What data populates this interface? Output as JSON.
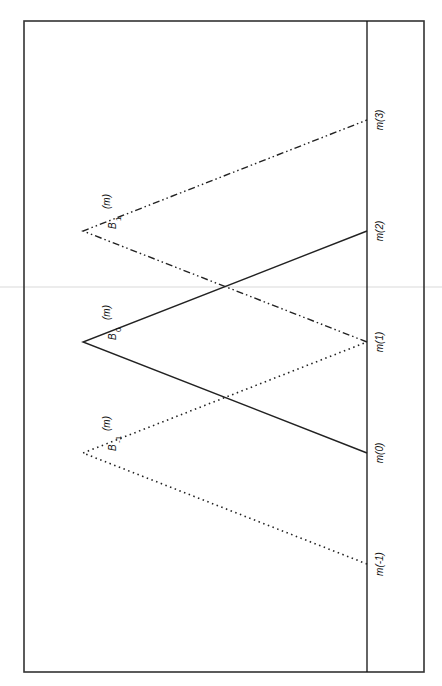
{
  "diagram": {
    "orientation": "rotated-90-clockwise",
    "knots": [
      {
        "id": "m-1",
        "label": "m(-1)",
        "index": -1
      },
      {
        "id": "m0",
        "label": "m(0)",
        "index": 0
      },
      {
        "id": "m1",
        "label": "m(1)",
        "index": 1
      },
      {
        "id": "m2",
        "label": "m(2)",
        "index": 2
      },
      {
        "id": "m3",
        "label": "m(3)",
        "index": 3
      }
    ],
    "functions": [
      {
        "id": "B-1",
        "symbol": "B",
        "subscript": "-1",
        "argument": "(m)",
        "start": -1,
        "peak": 0,
        "end": 1,
        "line_style": "dotted"
      },
      {
        "id": "B0",
        "symbol": "B",
        "subscript": "0",
        "argument": "(m)",
        "start": 0,
        "peak": 1,
        "end": 2,
        "line_style": "solid"
      },
      {
        "id": "B1",
        "symbol": "B",
        "subscript": "1",
        "argument": "(m)",
        "start": 1,
        "peak": 2,
        "end": 3,
        "line_style": "dash-dot"
      }
    ],
    "peak_height": 1,
    "colors": {
      "ink": "#222222",
      "frame": "#333333",
      "background": "#ffffff"
    }
  }
}
